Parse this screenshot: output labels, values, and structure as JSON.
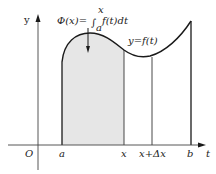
{
  "diagram": {
    "formula": {
      "lhs": "Φ(x)=",
      "integral_sign": "∫",
      "upper": "x",
      "lower": "a",
      "integrand": "f(t)dt"
    },
    "curve_label": "y=f(t)",
    "axes": {
      "y_label": "y",
      "x_label": "t",
      "origin": "O"
    },
    "ticks": [
      "a",
      "x",
      "x+Δx",
      "b"
    ],
    "colors": {
      "shaded": "#e6e6e6",
      "line": "#1a1a1a"
    }
  }
}
